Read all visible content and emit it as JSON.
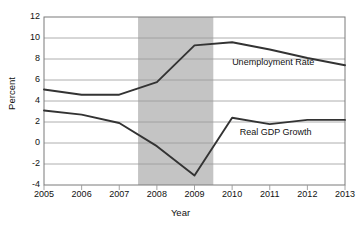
{
  "chart_data": {
    "type": "line",
    "title": "",
    "xlabel": "Year",
    "ylabel": "Percent",
    "xlim": [
      2005,
      2013
    ],
    "ylim": [
      -4,
      12
    ],
    "ytick_labels": [
      "12",
      "10",
      "8",
      "6",
      "4",
      "2",
      "0",
      "-2",
      "-4"
    ],
    "ytick_values": [
      12,
      10,
      8,
      6,
      4,
      2,
      0,
      -2,
      -4
    ],
    "xtick_labels": [
      "2005",
      "2006",
      "2007",
      "2008",
      "2009",
      "2010",
      "2011",
      "2012",
      "2013"
    ],
    "xtick_values": [
      2005,
      2006,
      2007,
      2008,
      2009,
      2010,
      2011,
      2012,
      2013
    ],
    "grid": true,
    "legend_position": "inline-annotation",
    "x": [
      2005,
      2006,
      2007,
      2008,
      2009,
      2010,
      2011,
      2012,
      2013
    ],
    "series": [
      {
        "name": "Unemployment Rate",
        "color": "#333333",
        "values": [
          5.1,
          4.6,
          4.6,
          5.8,
          9.3,
          9.6,
          8.9,
          8.1,
          7.4
        ]
      },
      {
        "name": "Real GDP Growth",
        "color": "#333333",
        "values": [
          3.1,
          2.7,
          1.9,
          -0.3,
          -3.1,
          2.4,
          1.8,
          2.2,
          2.2
        ]
      }
    ],
    "shaded_region": {
      "name": "recession-band",
      "x_start": 2007.5,
      "x_end": 2009.5,
      "color": "#c4c4c4"
    },
    "annotations": [
      {
        "text": "Unemployment Rate",
        "x": 2010.0,
        "y": 7.6
      },
      {
        "text": "Real GDP Growth",
        "x": 2010.2,
        "y": 1.0
      }
    ]
  },
  "axes": {
    "y_title": "Percent",
    "x_title": "Year"
  },
  "colors": {
    "line": "#333333",
    "grid": "#9a9a9a",
    "frame": "#7a7a7a",
    "shade": "#c4c4c4",
    "text": "#111111",
    "background": "#ffffff"
  }
}
